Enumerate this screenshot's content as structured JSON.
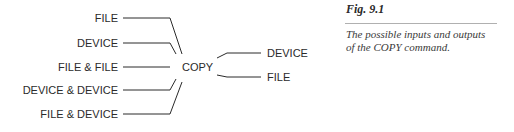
{
  "figure": {
    "number": "Fig. 9.1",
    "caption": "The possible inputs and outputs of the COPY command.",
    "caption_lines": [
      "The possible inputs and outputs",
      "of the COPY command."
    ]
  },
  "diagram": {
    "center": "COPY",
    "inputs": [
      {
        "label": "FILE"
      },
      {
        "label": "DEVICE"
      },
      {
        "label": "FILE & FILE"
      },
      {
        "label": "DEVICE & DEVICE"
      },
      {
        "label": "FILE & DEVICE"
      }
    ],
    "outputs": [
      {
        "label": "DEVICE"
      },
      {
        "label": "FILE"
      }
    ],
    "colors": {
      "line": "#2a2a2a",
      "text": "#2a2a2a",
      "rule": "#b0b0b0"
    }
  }
}
